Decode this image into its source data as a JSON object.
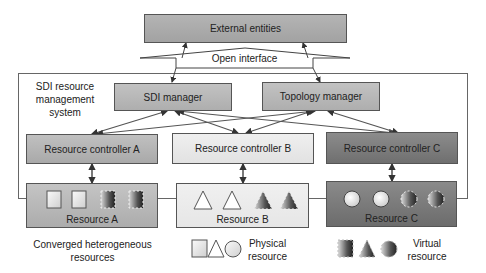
{
  "diagram": {
    "external": {
      "label": "External entities"
    },
    "open_interface": {
      "label": "Open interface"
    },
    "system": {
      "label_lines": [
        "SDI resource",
        "management",
        "system"
      ]
    },
    "managers": [
      {
        "label": "SDI manager"
      },
      {
        "label": "Topology manager"
      }
    ],
    "controllers": [
      {
        "label": "Resource controller A"
      },
      {
        "label": "Resource controller B"
      },
      {
        "label": "Resource controller C"
      }
    ],
    "resources": [
      {
        "label": "Resource A",
        "shape": "square"
      },
      {
        "label": "Resource B",
        "shape": "triangle"
      },
      {
        "label": "Resource C",
        "shape": "circle"
      }
    ],
    "captions": {
      "converged": [
        "Converged heterogeneous",
        "resources"
      ],
      "physical": [
        "Physical",
        "resource"
      ],
      "virtual": [
        "Virtual",
        "resource"
      ]
    },
    "colors": {
      "external": "#aaaaaa",
      "manager": "#b8b8b8",
      "controller_a": "#b4b4b4",
      "controller_b": "#e8e8e8",
      "controller_c": "#7e7e7e",
      "border": "#555555"
    }
  }
}
